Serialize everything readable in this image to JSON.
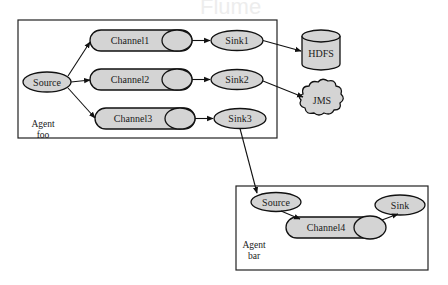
{
  "diagram": {
    "title_ghost": "Flume",
    "agents": [
      {
        "id": "foo",
        "label_line1": "Agent",
        "label_line2": "foo",
        "source": "Source",
        "channels": [
          "Channel1",
          "Channel2",
          "Channel3"
        ],
        "sinks": [
          "Sink1",
          "Sink2",
          "Sink3"
        ]
      },
      {
        "id": "bar",
        "label_line1": "Agent",
        "label_line2": "bar",
        "source": "Source",
        "channels": [
          "Channel4"
        ],
        "sinks": [
          "Sink"
        ]
      }
    ],
    "destinations": {
      "hdfs": "HDFS",
      "jms": "JMS"
    },
    "edges": [
      {
        "from": "foo.Source",
        "to": "Channel1"
      },
      {
        "from": "foo.Source",
        "to": "Channel2"
      },
      {
        "from": "foo.Source",
        "to": "Channel3"
      },
      {
        "from": "Channel1",
        "to": "Sink1"
      },
      {
        "from": "Channel2",
        "to": "Sink2"
      },
      {
        "from": "Channel3",
        "to": "Sink3"
      },
      {
        "from": "Sink1",
        "to": "HDFS"
      },
      {
        "from": "Sink2",
        "to": "JMS"
      },
      {
        "from": "Sink3",
        "to": "bar.Source"
      },
      {
        "from": "bar.Source",
        "to": "Channel4"
      },
      {
        "from": "Channel4",
        "to": "bar.Sink"
      }
    ],
    "colors": {
      "node_fill": "#d4d4d4",
      "stroke": "#111111",
      "background": "#ffffff"
    }
  }
}
